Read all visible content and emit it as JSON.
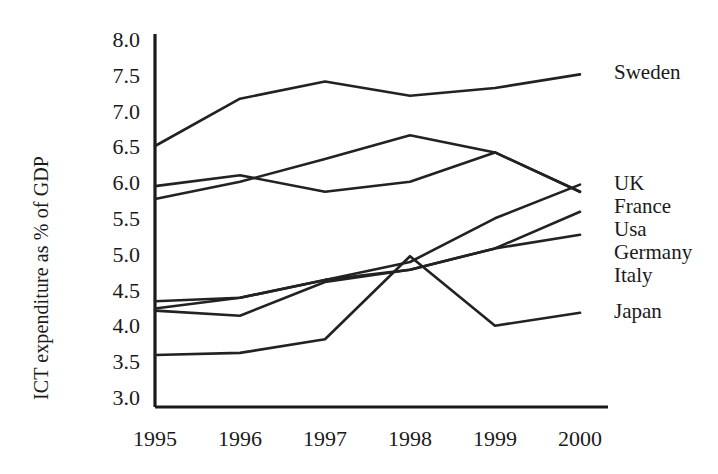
{
  "chart_data": {
    "type": "line",
    "title": "",
    "xlabel": "",
    "ylabel": "ICT expenditure as % of GDP",
    "categories": [
      "1995",
      "1996",
      "1997",
      "1998",
      "1999",
      "2000"
    ],
    "x": [
      1995,
      1996,
      1997,
      1998,
      1999,
      2000
    ],
    "ylim": [
      3.0,
      8.0
    ],
    "xlim": [
      1995,
      2000
    ],
    "yticks": [
      "3.0",
      "3.5",
      "4.0",
      "4.5",
      "5.0",
      "5.5",
      "6.0",
      "6.5",
      "7.0",
      "7.5",
      "8.0"
    ],
    "ytick_values": [
      3.0,
      3.5,
      4.0,
      4.5,
      5.0,
      5.5,
      6.0,
      6.5,
      7.0,
      7.5,
      8.0
    ],
    "grid": false,
    "legend_position": "right-inline-end-of-line",
    "line_color": "#222222",
    "series": [
      {
        "name": "Sweden",
        "values": [
          6.52,
          7.18,
          7.42,
          7.22,
          7.33,
          7.52
        ]
      },
      {
        "name": "UK",
        "values": [
          4.25,
          4.4,
          4.65,
          4.9,
          5.51,
          5.98
        ]
      },
      {
        "name": "France",
        "values": [
          5.96,
          6.11,
          5.88,
          6.02,
          6.43,
          5.88
        ]
      },
      {
        "name": "Usa",
        "values": [
          5.78,
          6.02,
          6.34,
          6.67,
          6.43,
          5.88
        ]
      },
      {
        "name": "Germany",
        "values": [
          4.22,
          4.15,
          4.62,
          4.79,
          5.09,
          5.6
        ]
      },
      {
        "name": "Italy",
        "values": [
          4.35,
          4.4,
          4.65,
          4.79,
          5.09,
          5.28
        ]
      },
      {
        "name": "Japan",
        "values": [
          3.6,
          3.63,
          3.82,
          4.98,
          4.01,
          4.19
        ]
      }
    ]
  },
  "axis": {
    "yaxis_title": "ICT expenditure as % of GDP"
  }
}
